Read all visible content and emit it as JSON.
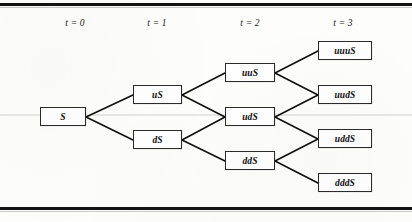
{
  "figure": {
    "background_color": "#fdfdfc",
    "rule_color": "#131313",
    "node_border_color": "#2a2a2a",
    "edge_color": "#101010"
  },
  "columns": [
    {
      "label": "t = 0",
      "x": 75
    },
    {
      "label": "t = 1",
      "x": 157
    },
    {
      "label": "t = 2",
      "x": 250
    },
    {
      "label": "t = 3",
      "x": 343
    }
  ],
  "nodes": [
    {
      "id": "S",
      "label": "S",
      "t": 0,
      "x": 40,
      "y": 107,
      "w": 46,
      "h": 19
    },
    {
      "id": "uS",
      "label": "uS",
      "t": 1,
      "x": 133,
      "y": 85,
      "w": 49,
      "h": 19
    },
    {
      "id": "dS",
      "label": "dS",
      "t": 1,
      "x": 133,
      "y": 130,
      "w": 49,
      "h": 19
    },
    {
      "id": "uuS",
      "label": "uuS",
      "t": 2,
      "x": 225,
      "y": 63,
      "w": 50,
      "h": 19
    },
    {
      "id": "udS",
      "label": "udS",
      "t": 2,
      "x": 225,
      "y": 107,
      "w": 50,
      "h": 19
    },
    {
      "id": "ddS",
      "label": "ddS",
      "t": 2,
      "x": 225,
      "y": 151,
      "w": 50,
      "h": 19
    },
    {
      "id": "uuuS",
      "label": "uuuS",
      "t": 3,
      "x": 318,
      "y": 41,
      "w": 54,
      "h": 19
    },
    {
      "id": "uudS",
      "label": "uudS",
      "t": 3,
      "x": 318,
      "y": 85,
      "w": 54,
      "h": 19
    },
    {
      "id": "uddS",
      "label": "uddS",
      "t": 3,
      "x": 318,
      "y": 129,
      "w": 54,
      "h": 19
    },
    {
      "id": "dddS",
      "label": "dddS",
      "t": 3,
      "x": 318,
      "y": 173,
      "w": 54,
      "h": 19
    }
  ],
  "edges": [
    {
      "from": "S",
      "to": "uS",
      "x1": 86,
      "y1": 117,
      "x2": 133,
      "y2": 95
    },
    {
      "from": "S",
      "to": "dS",
      "x1": 86,
      "y1": 117,
      "x2": 133,
      "y2": 140
    },
    {
      "from": "uS",
      "to": "uuS",
      "x1": 182,
      "y1": 95,
      "x2": 225,
      "y2": 73
    },
    {
      "from": "uS",
      "to": "udS",
      "x1": 182,
      "y1": 95,
      "x2": 225,
      "y2": 117
    },
    {
      "from": "dS",
      "to": "udS",
      "x1": 182,
      "y1": 140,
      "x2": 225,
      "y2": 117
    },
    {
      "from": "dS",
      "to": "ddS",
      "x1": 182,
      "y1": 140,
      "x2": 225,
      "y2": 161
    },
    {
      "from": "uuS",
      "to": "uuuS",
      "x1": 275,
      "y1": 73,
      "x2": 318,
      "y2": 51
    },
    {
      "from": "uuS",
      "to": "uudS",
      "x1": 275,
      "y1": 73,
      "x2": 318,
      "y2": 95
    },
    {
      "from": "udS",
      "to": "uudS",
      "x1": 275,
      "y1": 117,
      "x2": 318,
      "y2": 95
    },
    {
      "from": "udS",
      "to": "uddS",
      "x1": 275,
      "y1": 117,
      "x2": 318,
      "y2": 139
    },
    {
      "from": "ddS",
      "to": "uddS",
      "x1": 275,
      "y1": 161,
      "x2": 318,
      "y2": 139
    },
    {
      "from": "ddS",
      "to": "dddS",
      "x1": 275,
      "y1": 161,
      "x2": 318,
      "y2": 183
    }
  ]
}
